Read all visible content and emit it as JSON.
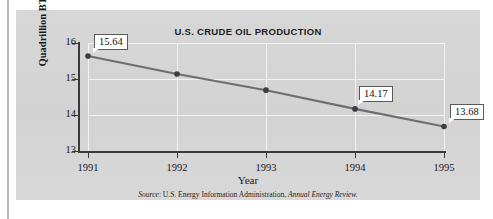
{
  "figure": {
    "title": "U.S. CRUDE OIL PRODUCTION",
    "source_prefix": "Source",
    "source_sep": ": ",
    "source_body": "U.S. Energy Information Administration, ",
    "source_publication": "Annual Energy Review.",
    "panel_color": "#d5d5d5",
    "line_color": "#6e6e6e",
    "marker_color": "#3d3d3d",
    "axis_color": "#3a3a3a",
    "gridline_color": "#f2f2f2"
  },
  "chart_data": {
    "type": "line",
    "title": "U.S. CRUDE OIL PRODUCTION",
    "xlabel": "Year",
    "ylabel": "Quadrillion BTUs",
    "categories": [
      "1991",
      "1992",
      "1993",
      "1994",
      "1995"
    ],
    "x": [
      1991,
      1992,
      1993,
      1994,
      1995
    ],
    "values": [
      15.64,
      15.14,
      14.69,
      14.17,
      13.68
    ],
    "point_labels": [
      "15.64",
      "",
      "",
      "14.17",
      "13.68"
    ],
    "labeled_points": [
      {
        "x": "1991",
        "y": 15.64,
        "label": "15.64"
      },
      {
        "x": "1994",
        "y": 14.17,
        "label": "14.17"
      },
      {
        "x": "1995",
        "y": 13.68,
        "label": "13.68"
      }
    ],
    "ylim": [
      13,
      16
    ],
    "yticks": [
      13,
      14,
      15,
      16
    ],
    "ytick_labels": [
      "13",
      "14",
      "15",
      "16"
    ],
    "xtick_labels": [
      "1991",
      "1992",
      "1993",
      "1994",
      "1995"
    ],
    "grid": true,
    "grid_axes": "both",
    "legend": false,
    "legend_position": "none",
    "units": "Quadrillion BTUs",
    "series": [
      {
        "name": "U.S. Crude Oil Production",
        "values": [
          15.64,
          15.14,
          14.69,
          14.17,
          13.68
        ]
      }
    ],
    "annotations": [
      "Source: U.S. Energy Information Administration, Annual Energy Review."
    ]
  }
}
